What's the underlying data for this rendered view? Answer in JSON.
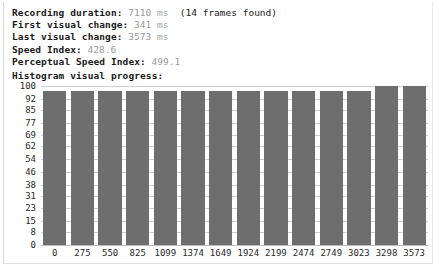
{
  "summary": {
    "lines": [
      {
        "label": "Recording duration:",
        "value": "7110",
        "unit": "ms",
        "extra": "(14 frames found)"
      },
      {
        "label": "First visual change:",
        "value": "341",
        "unit": "ms",
        "extra": ""
      },
      {
        "label": "Last visual change:",
        "value": "3573",
        "unit": "ms",
        "extra": ""
      },
      {
        "label": "Speed Index:",
        "value": "428.6",
        "unit": "",
        "extra": ""
      },
      {
        "label": "Perceptual Speed Index:",
        "value": "499.1",
        "unit": "",
        "extra": ""
      }
    ]
  },
  "histogram": {
    "title": "Histogram visual progress:"
  },
  "chart_data": {
    "type": "bar",
    "title": "Histogram visual progress:",
    "xlabel": "",
    "ylabel": "",
    "grid": true,
    "legend": "none",
    "bar_color": "#6e6e6e",
    "ylim": [
      0,
      100
    ],
    "yticks": [
      100,
      92,
      85,
      77,
      69,
      62,
      54,
      46,
      38,
      31,
      23,
      15,
      8,
      0
    ],
    "categories": [
      "0",
      "275",
      "550",
      "825",
      "1099",
      "1374",
      "1649",
      "1924",
      "2199",
      "2474",
      "2749",
      "3023",
      "3298",
      "3573"
    ],
    "values": [
      97,
      97,
      97,
      97,
      97,
      97,
      97,
      97,
      97,
      97,
      97,
      97,
      100,
      100
    ]
  }
}
